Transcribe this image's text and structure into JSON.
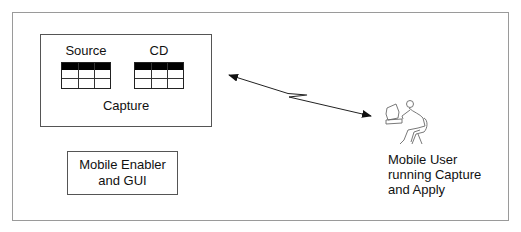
{
  "diagram": {
    "capture_group": {
      "label": "Capture",
      "tables": [
        {
          "label": "Source"
        },
        {
          "label": "CD"
        }
      ]
    },
    "enabler_box": {
      "line1": "Mobile Enabler",
      "line2": "and GUI"
    },
    "mobile_user": {
      "icon": "person-at-computer-icon",
      "line1": "Mobile User",
      "line2": "running Capture",
      "line3": "and Apply"
    },
    "connection": {
      "type": "bidirectional-wireless-link",
      "icon": "lightning-zigzag"
    },
    "colors": {
      "frame": "#9a9a9a",
      "stroke": "#555555",
      "table_header": "#000000",
      "arrow": "#222222",
      "icon": "#666666"
    }
  }
}
